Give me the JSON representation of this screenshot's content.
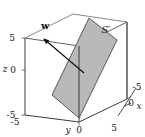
{
  "figure": {
    "background_color": "#ffffff",
    "box_edge_color": "#555555",
    "box_edge_color_front": "#2b2b2b",
    "plane_fill_color": "#b9b9b9",
    "plane_edge_color": "#4a4a4a",
    "vector_color": "#111111",
    "tick_color": "#555555"
  },
  "axes": {
    "z": {
      "name": "z",
      "label": "z",
      "ticks": [
        {
          "value": "5",
          "label": "5"
        },
        {
          "value": "0",
          "label": "0"
        },
        {
          "value": "-5",
          "label": "-5"
        }
      ]
    },
    "y": {
      "name": "y",
      "label": "y",
      "ticks": [
        {
          "value": "-5",
          "label": "-5"
        },
        {
          "value": "0",
          "label": "0"
        },
        {
          "value": "5",
          "label": "5"
        }
      ]
    },
    "x": {
      "name": "x",
      "label": "x",
      "ticks": [
        {
          "value": "-5",
          "label": "-5"
        },
        {
          "value": "0",
          "label": "0"
        }
      ]
    }
  },
  "annotations": {
    "vector": {
      "name": "w",
      "label": "w"
    },
    "surface": {
      "name": "S-prime",
      "label": "S′"
    }
  }
}
